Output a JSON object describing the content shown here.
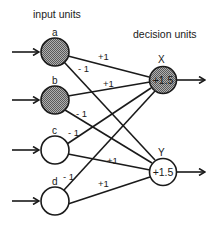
{
  "headers": {
    "input": "input units",
    "decision": "decision units"
  },
  "colors": {
    "stroke": "#1a1a1a",
    "shaded_fill": "#8c8c8c",
    "empty_fill": "#ffffff"
  },
  "input_units": [
    {
      "id": "a",
      "label": "a",
      "active": true
    },
    {
      "id": "b",
      "label": "b",
      "active": true
    },
    {
      "id": "c",
      "label": "c",
      "active": false
    },
    {
      "id": "d",
      "label": "d",
      "active": false
    }
  ],
  "decision_units": [
    {
      "id": "X",
      "label": "X",
      "threshold": "+1.5",
      "active": true
    },
    {
      "id": "Y",
      "label": "Y",
      "threshold": "+1.5",
      "active": false
    }
  ],
  "weights": [
    {
      "from": "a",
      "to": "X",
      "value": "+1"
    },
    {
      "from": "a",
      "to": "Y",
      "value": "- 1"
    },
    {
      "from": "b",
      "to": "X",
      "value": "+1"
    },
    {
      "from": "b",
      "to": "Y",
      "value": "- 1"
    },
    {
      "from": "c",
      "to": "X",
      "value": "- 1"
    },
    {
      "from": "c",
      "to": "Y",
      "value": "+1"
    },
    {
      "from": "d",
      "to": "X",
      "value": "- 1"
    },
    {
      "from": "d",
      "to": "Y",
      "value": "+1"
    }
  ]
}
